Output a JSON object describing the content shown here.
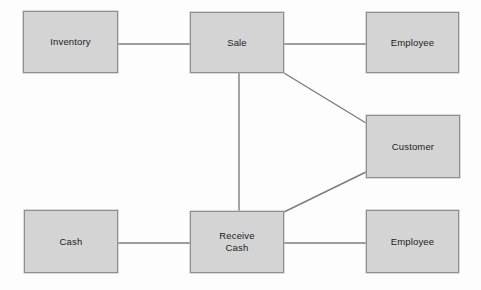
{
  "diagram": {
    "type": "entity-relationship",
    "background_color": "#fdfdfd",
    "box_fill_color": "#d4d4d5",
    "box_border_color": "#8e8e90",
    "connector_color": "#7c7c7e",
    "canvas": {
      "width": 481,
      "height": 290
    },
    "boxes": [
      {
        "id": "inventory",
        "label": "Inventory",
        "x": 23,
        "y": 11,
        "width": 95,
        "height": 62
      },
      {
        "id": "sale",
        "label": "Sale",
        "x": 190,
        "y": 12,
        "width": 94,
        "height": 61
      },
      {
        "id": "employee-top",
        "label": "Employee",
        "x": 366,
        "y": 12,
        "width": 93,
        "height": 61
      },
      {
        "id": "customer",
        "label": "Customer",
        "x": 366,
        "y": 115,
        "width": 94,
        "height": 63
      },
      {
        "id": "cash",
        "label": "Cash",
        "x": 24,
        "y": 210,
        "width": 94,
        "height": 63
      },
      {
        "id": "receive-cash",
        "label": "Receive\nCash",
        "x": 190,
        "y": 211,
        "width": 94,
        "height": 62
      },
      {
        "id": "employee-bottom",
        "label": "Employee",
        "x": 366,
        "y": 210,
        "width": 93,
        "height": 63
      }
    ],
    "connectors": [
      {
        "id": "inventory-sale",
        "from": "inventory",
        "to": "sale",
        "x1": 118,
        "y1": 44,
        "x2": 190,
        "y2": 44
      },
      {
        "id": "sale-employee-top",
        "from": "sale",
        "to": "employee-top",
        "x1": 284,
        "y1": 44,
        "x2": 366,
        "y2": 44
      },
      {
        "id": "sale-customer",
        "from": "sale",
        "to": "customer",
        "x1": 284,
        "y1": 73,
        "x2": 366,
        "y2": 123
      },
      {
        "id": "sale-receive-cash",
        "from": "sale",
        "to": "receive-cash",
        "x1": 239,
        "y1": 73,
        "x2": 239,
        "y2": 211
      },
      {
        "id": "receive-cash-customer",
        "from": "receive-cash",
        "to": "customer",
        "x1": 284,
        "y1": 212,
        "x2": 366,
        "y2": 172
      },
      {
        "id": "cash-receive-cash",
        "from": "cash",
        "to": "receive-cash",
        "x1": 118,
        "y1": 243,
        "x2": 190,
        "y2": 243
      },
      {
        "id": "receive-cash-employee-bottom",
        "from": "receive-cash",
        "to": "employee-bottom",
        "x1": 284,
        "y1": 243,
        "x2": 366,
        "y2": 243
      }
    ]
  }
}
